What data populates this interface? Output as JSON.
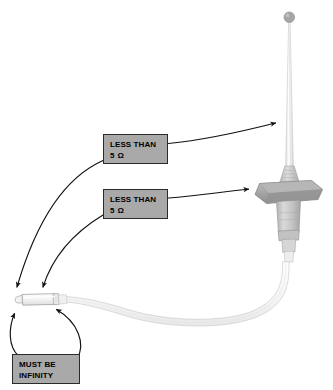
{
  "diagram": {
    "background_color": "#ffffff",
    "callouts": [
      {
        "id": "antenna-mast",
        "line1": "LESS THAN",
        "line2": "5 Ω",
        "points_to": "antenna-whip-mast",
        "box_color": "#a9a9a9",
        "border_color": "#2b2b2b",
        "text_color": "#000000"
      },
      {
        "id": "antenna-base",
        "line1": "LESS THAN",
        "line2": "5 Ω",
        "points_to": "antenna-base-plate",
        "box_color": "#a9a9a9",
        "border_color": "#2b2b2b",
        "text_color": "#000000"
      },
      {
        "id": "cable-shield",
        "line1": "MUST BE",
        "line2": "INFINITY",
        "points_to": "coax-connector",
        "box_color": "#a9a9a9",
        "border_color": "#2b2b2b",
        "text_color": "#000000"
      }
    ],
    "parts": {
      "antenna_tip": "antenna-tip-ball",
      "antenna_mast": "antenna-whip-mast",
      "antenna_base_plate": "antenna-base-plate",
      "antenna_body": "antenna-lower-body",
      "coax_cable": "coax-cable",
      "coax_connector": "coax-connector"
    },
    "colors": {
      "leader_line": "#111111",
      "part_fill_light": "#fbfbfb",
      "part_fill_mid": "#c9c9c9",
      "part_fill_dark": "#9a9a9a",
      "part_outline": "#8d8d8d",
      "cable_outline": "#c6c6c6"
    }
  }
}
